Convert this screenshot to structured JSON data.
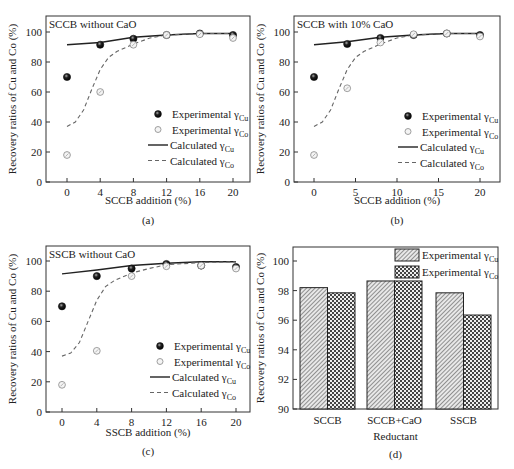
{
  "chart_data": [
    {
      "type": "scatter",
      "panel_label": "(a)",
      "title": "SCCB without CaO",
      "xlabel": "SCCB addition (%)",
      "ylabel": "Recovery ratios of Cu and Co (%)",
      "xlim": [
        -2.5,
        22
      ],
      "ylim": [
        0,
        110
      ],
      "xticks": [
        0,
        4,
        8,
        12,
        16,
        20
      ],
      "yticks": [
        0,
        20,
        40,
        60,
        80,
        100
      ],
      "legend_position": "bottom-right",
      "series": [
        {
          "name": "Experimental γCu",
          "kind": "marker-filled",
          "x": [
            0,
            4,
            8,
            12,
            16,
            20
          ],
          "y": [
            70,
            91.5,
            95.5,
            98,
            99,
            98
          ]
        },
        {
          "name": "Experimental γCo",
          "kind": "marker-open",
          "x": [
            0,
            4,
            8,
            12,
            16,
            20
          ],
          "y": [
            18,
            60,
            91.5,
            98,
            98.5,
            96
          ]
        },
        {
          "name": "Calculated γCu",
          "kind": "line-solid",
          "x": [
            0,
            4,
            8,
            12,
            16,
            20
          ],
          "y": [
            91.5,
            93,
            96.5,
            98,
            99,
            99
          ]
        },
        {
          "name": "Calculated γCo",
          "kind": "line-dashed",
          "x": [
            0,
            1,
            2,
            3,
            4,
            5,
            6,
            8,
            10,
            12,
            16,
            20
          ],
          "y": [
            37,
            40,
            48,
            62,
            75,
            83,
            87,
            92,
            96,
            98,
            99,
            99
          ]
        }
      ]
    },
    {
      "type": "scatter",
      "panel_label": "(b)",
      "title": "SCCB with 10% CaO",
      "xlabel": "SCCB addition (%)",
      "ylabel": "Recovery ratios of Cu and Co (%)",
      "xlim": [
        -2.5,
        22.5
      ],
      "ylim": [
        0,
        110
      ],
      "xticks": [
        0,
        5,
        10,
        15,
        20
      ],
      "yticks": [
        0,
        20,
        40,
        60,
        80,
        100
      ],
      "legend_position": "bottom-right",
      "series": [
        {
          "name": "Experimental γCu",
          "kind": "marker-filled",
          "x": [
            0,
            4,
            8,
            12,
            16,
            20
          ],
          "y": [
            70,
            92,
            96,
            98,
            99,
            98
          ]
        },
        {
          "name": "Experimental γCo",
          "kind": "marker-open",
          "x": [
            0,
            4,
            8,
            12,
            16,
            20
          ],
          "y": [
            18,
            62.5,
            93,
            98.5,
            99,
            97
          ]
        },
        {
          "name": "Calculated γCu",
          "kind": "line-solid",
          "x": [
            0,
            4,
            8,
            12,
            16,
            20
          ],
          "y": [
            91.5,
            93.5,
            96.5,
            98,
            99,
            99
          ]
        },
        {
          "name": "Calculated γCo",
          "kind": "line-dashed",
          "x": [
            0,
            1,
            2,
            3,
            4,
            5,
            6,
            8,
            10,
            12,
            16,
            20
          ],
          "y": [
            37,
            40,
            48,
            62,
            75,
            83,
            87,
            92,
            96,
            98,
            99,
            99
          ]
        }
      ]
    },
    {
      "type": "scatter",
      "panel_label": "(c)",
      "title": "SSCB without CaO",
      "xlabel": "SSCB addition (%)",
      "ylabel": "Recovery ratios of Cu and Co (%)",
      "xlim": [
        -2.5,
        22
      ],
      "ylim": [
        0,
        110
      ],
      "xticks": [
        0,
        4,
        8,
        12,
        16,
        20
      ],
      "yticks": [
        0,
        20,
        40,
        60,
        80,
        100
      ],
      "legend_position": "bottom-right",
      "series": [
        {
          "name": "Experimental γCu",
          "kind": "marker-filled",
          "x": [
            0,
            4,
            8,
            12,
            16,
            20
          ],
          "y": [
            70,
            90,
            95,
            98,
            97,
            96
          ]
        },
        {
          "name": "Experimental γCo",
          "kind": "marker-open",
          "x": [
            0,
            4,
            8,
            12,
            16,
            20
          ],
          "y": [
            18,
            40.5,
            90,
            96.5,
            97,
            95
          ]
        },
        {
          "name": "Calculated γCu",
          "kind": "line-solid",
          "x": [
            0,
            4,
            8,
            12,
            16,
            20
          ],
          "y": [
            91.5,
            94,
            97,
            98.5,
            99.5,
            99.5
          ]
        },
        {
          "name": "Calculated γCo",
          "kind": "line-dashed",
          "x": [
            0,
            1,
            2,
            3,
            4,
            5,
            6,
            8,
            10,
            12,
            16,
            20
          ],
          "y": [
            37,
            39,
            46,
            60,
            74,
            83,
            87,
            92,
            95,
            97.5,
            99,
            99.5
          ]
        }
      ]
    },
    {
      "type": "bar",
      "panel_label": "(d)",
      "title": "",
      "xlabel": "Reductant",
      "ylabel": "Recovery ratios of Cu and Co  (%)",
      "categories": [
        "SCCB",
        "SCCB+CaO",
        "SSCB"
      ],
      "ylim": [
        90,
        101
      ],
      "yticks": [
        90,
        92,
        94,
        96,
        98,
        100
      ],
      "legend_position": "top-right",
      "series": [
        {
          "name": "Experimental γCu",
          "pattern": "diagonal-hatch",
          "values": [
            98.2,
            98.65,
            97.85
          ]
        },
        {
          "name": "Experimental γCo",
          "pattern": "checker",
          "values": [
            97.85,
            98.65,
            96.35
          ]
        }
      ]
    }
  ]
}
